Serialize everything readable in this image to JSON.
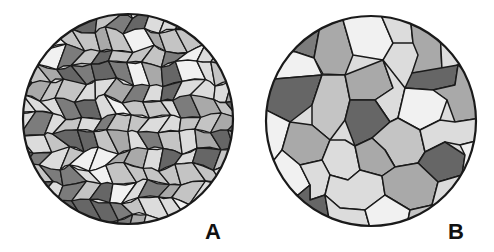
{
  "figure": {
    "title": ""
  },
  "colors": {
    "background": "#ffffff",
    "boundary": "#1a1a1a",
    "shades": {
      "white": "#f1f1f1",
      "light": "#dcdcdc",
      "mid_light": "#c4c4c4",
      "mid": "#a9a9a9",
      "dark": "#7c7c7c",
      "darker": "#666666"
    }
  },
  "panels": [
    {
      "id": "A",
      "label": "A",
      "grain_size": "fine",
      "circle": {
        "cx": 128,
        "cy": 119,
        "r": 105
      },
      "generator": {
        "type": "jittered-grid",
        "cell": 17,
        "seed": 7
      },
      "grains": []
    },
    {
      "id": "B",
      "label": "B",
      "grain_size": "coarse",
      "circle": {
        "cx": 371,
        "cy": 121,
        "r": 105
      },
      "grains": [
        {
          "shade": "dark",
          "points": [
            [
              282,
              30
            ],
            [
              320,
              26
            ],
            [
              314,
              58
            ],
            [
              296,
              52
            ],
            [
              276,
              44
            ]
          ]
        },
        {
          "shade": "mid",
          "points": [
            [
              320,
              26
            ],
            [
              343,
              20
            ],
            [
              353,
              55
            ],
            [
              345,
              75
            ],
            [
              323,
              74
            ],
            [
              314,
              58
            ]
          ]
        },
        {
          "shade": "white",
          "points": [
            [
              343,
              20
            ],
            [
              378,
              8
            ],
            [
              393,
              43
            ],
            [
              383,
              60
            ],
            [
              353,
              55
            ]
          ]
        },
        {
          "shade": "light",
          "points": [
            [
              378,
              8
            ],
            [
              410,
              14
            ],
            [
              413,
              43
            ],
            [
              393,
              43
            ]
          ]
        },
        {
          "shade": "mid",
          "points": [
            [
              410,
              14
            ],
            [
              440,
              30
            ],
            [
              442,
              70
            ],
            [
              412,
              73
            ],
            [
              418,
              55
            ],
            [
              413,
              43
            ]
          ]
        },
        {
          "shade": "light",
          "points": [
            [
              440,
              30
            ],
            [
              465,
              50
            ],
            [
              458,
              65
            ],
            [
              442,
              70
            ]
          ]
        },
        {
          "shade": "darker",
          "points": [
            [
              412,
              73
            ],
            [
              458,
              65
            ],
            [
              455,
              85
            ],
            [
              433,
              90
            ],
            [
              405,
              88
            ]
          ]
        },
        {
          "shade": "mid",
          "points": [
            [
              458,
              65
            ],
            [
              480,
              85
            ],
            [
              480,
              118
            ],
            [
              455,
              122
            ],
            [
              447,
              100
            ],
            [
              433,
              90
            ],
            [
              455,
              85
            ]
          ]
        },
        {
          "shade": "white",
          "points": [
            [
              270,
              48
            ],
            [
              296,
              52
            ],
            [
              314,
              58
            ],
            [
              322,
              75
            ],
            [
              298,
              77
            ],
            [
              262,
              80
            ]
          ]
        },
        {
          "shade": "darker",
          "points": [
            [
              262,
              80
            ],
            [
              322,
              75
            ],
            [
              312,
              105
            ],
            [
              290,
              122
            ],
            [
              262,
              108
            ]
          ]
        },
        {
          "shade": "mid_light",
          "points": [
            [
              322,
              75
            ],
            [
              345,
              75
            ],
            [
              350,
              100
            ],
            [
              345,
              120
            ],
            [
              330,
              140
            ],
            [
              312,
              125
            ],
            [
              312,
              105
            ]
          ]
        },
        {
          "shade": "mid",
          "points": [
            [
              345,
              75
            ],
            [
              383,
              60
            ],
            [
              393,
              88
            ],
            [
              375,
              100
            ],
            [
              350,
              100
            ]
          ]
        },
        {
          "shade": "light",
          "points": [
            [
              383,
              60
            ],
            [
              405,
              88
            ],
            [
              398,
              118
            ],
            [
              390,
              122
            ],
            [
              375,
              100
            ],
            [
              393,
              88
            ]
          ]
        },
        {
          "shade": "white",
          "points": [
            [
              405,
              88
            ],
            [
              433,
              90
            ],
            [
              447,
              100
            ],
            [
              440,
              120
            ],
            [
              420,
              130
            ],
            [
              398,
              118
            ]
          ]
        },
        {
          "shade": "darker",
          "points": [
            [
              350,
              100
            ],
            [
              375,
              100
            ],
            [
              390,
              122
            ],
            [
              372,
              138
            ],
            [
              355,
              146
            ],
            [
              345,
              120
            ]
          ]
        },
        {
          "shade": "white",
          "points": [
            [
              262,
              108
            ],
            [
              290,
              122
            ],
            [
              282,
              150
            ],
            [
              270,
              165
            ],
            [
              258,
              150
            ]
          ]
        },
        {
          "shade": "mid",
          "points": [
            [
              290,
              122
            ],
            [
              312,
              125
            ],
            [
              330,
              140
            ],
            [
              322,
              160
            ],
            [
              300,
              165
            ],
            [
              282,
              150
            ]
          ]
        },
        {
          "shade": "mid_light",
          "points": [
            [
              390,
              122
            ],
            [
              398,
              118
            ],
            [
              420,
              130
            ],
            [
              425,
              152
            ],
            [
              418,
              163
            ],
            [
              395,
              167
            ],
            [
              385,
              150
            ],
            [
              372,
              138
            ]
          ]
        },
        {
          "shade": "light",
          "points": [
            [
              440,
              120
            ],
            [
              455,
              122
            ],
            [
              480,
              118
            ],
            [
              480,
              140
            ],
            [
              460,
              145
            ],
            [
              445,
              142
            ],
            [
              425,
              152
            ],
            [
              420,
              130
            ]
          ]
        },
        {
          "shade": "darker",
          "points": [
            [
              425,
              152
            ],
            [
              445,
              142
            ],
            [
              465,
              155
            ],
            [
              462,
              175
            ],
            [
              438,
              182
            ],
            [
              418,
              163
            ]
          ]
        },
        {
          "shade": "white",
          "points": [
            [
              460,
              145
            ],
            [
              480,
              140
            ],
            [
              480,
              180
            ],
            [
              462,
              175
            ],
            [
              465,
              155
            ]
          ]
        },
        {
          "shade": "light",
          "points": [
            [
              330,
              140
            ],
            [
              345,
              140
            ],
            [
              355,
              146
            ],
            [
              360,
              170
            ],
            [
              348,
              180
            ],
            [
              330,
              175
            ],
            [
              322,
              160
            ]
          ]
        },
        {
          "shade": "mid",
          "points": [
            [
              355,
              146
            ],
            [
              372,
              138
            ],
            [
              385,
              150
            ],
            [
              395,
              167
            ],
            [
              382,
              176
            ],
            [
              360,
              170
            ]
          ]
        },
        {
          "shade": "white",
          "points": [
            [
              270,
              165
            ],
            [
              282,
              150
            ],
            [
              300,
              165
            ],
            [
              310,
              185
            ],
            [
              298,
              195
            ],
            [
              275,
              188
            ],
            [
              262,
              178
            ]
          ]
        },
        {
          "shade": "light",
          "points": [
            [
              300,
              165
            ],
            [
              322,
              160
            ],
            [
              330,
              175
            ],
            [
              325,
              195
            ],
            [
              310,
              200
            ],
            [
              310,
              185
            ]
          ]
        },
        {
          "shade": "light",
          "points": [
            [
              330,
              175
            ],
            [
              348,
              180
            ],
            [
              360,
              170
            ],
            [
              382,
              176
            ],
            [
              385,
              195
            ],
            [
              365,
              210
            ],
            [
              340,
              208
            ],
            [
              325,
              195
            ]
          ]
        },
        {
          "shade": "mid",
          "points": [
            [
              382,
              176
            ],
            [
              395,
              167
            ],
            [
              418,
              163
            ],
            [
              438,
              182
            ],
            [
              432,
              205
            ],
            [
              410,
              210
            ],
            [
              385,
              195
            ]
          ]
        },
        {
          "shade": "light",
          "points": [
            [
              438,
              182
            ],
            [
              462,
              175
            ],
            [
              480,
              180
            ],
            [
              480,
              210
            ],
            [
              455,
              218
            ],
            [
              432,
              205
            ]
          ]
        },
        {
          "shade": "darker",
          "points": [
            [
              298,
              195
            ],
            [
              310,
              185
            ],
            [
              310,
              200
            ],
            [
              325,
              195
            ],
            [
              330,
              225
            ],
            [
              310,
              235
            ],
            [
              290,
              225
            ],
            [
              280,
              205
            ]
          ]
        },
        {
          "shade": "white",
          "points": [
            [
              262,
              178
            ],
            [
              275,
              188
            ],
            [
              298,
              195
            ],
            [
              280,
              205
            ],
            [
              262,
              200
            ]
          ]
        },
        {
          "shade": "light",
          "points": [
            [
              325,
              195
            ],
            [
              340,
              208
            ],
            [
              365,
              210
            ],
            [
              372,
              235
            ],
            [
              330,
              235
            ],
            [
              330,
              225
            ]
          ]
        },
        {
          "shade": "white",
          "points": [
            [
              365,
              210
            ],
            [
              385,
              195
            ],
            [
              410,
              210
            ],
            [
              405,
              235
            ],
            [
              372,
              235
            ]
          ]
        },
        {
          "shade": "mid_light",
          "points": [
            [
              410,
              210
            ],
            [
              432,
              205
            ],
            [
              455,
              218
            ],
            [
              450,
              235
            ],
            [
              405,
              235
            ]
          ]
        }
      ]
    }
  ]
}
